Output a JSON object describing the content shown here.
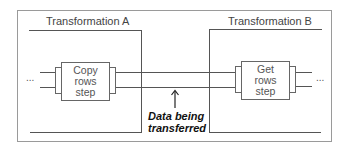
{
  "diagram": {
    "transformation_a": {
      "title": "Transformation A"
    },
    "transformation_b": {
      "title": "Transformation B"
    },
    "step_a": {
      "line1": "Copy",
      "line2": "rows",
      "line3": "step"
    },
    "step_b": {
      "line1": "Get",
      "line2": "rows",
      "line3": "step"
    },
    "ellipsis_left": "...",
    "ellipsis_right": "...",
    "caption": {
      "line1": "Data being",
      "line2": "transferred"
    },
    "colors": {
      "frame": "#9a9a9a",
      "line": "#555555",
      "text": "#333333",
      "caption": "#111111"
    }
  }
}
